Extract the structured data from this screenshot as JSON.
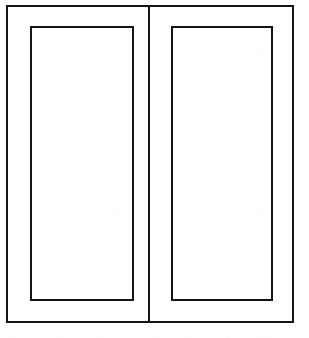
{
  "drawing": {
    "subject": "double-door-elevation",
    "description": "Line drawing of a two-leaf panelled door seen in elevation",
    "background_color": "#ffffff",
    "line_color": "#151515",
    "line_width": 2,
    "canvas": {
      "width": 309,
      "height": 338
    },
    "outer_frame": {
      "name": "outer-frame",
      "x": 7,
      "y": 6,
      "width": 286,
      "height": 316,
      "right": 293,
      "bottom": 322
    },
    "mullion": {
      "name": "center-mullion",
      "x": 149,
      "y_top": 6,
      "y_bottom": 322
    },
    "leaves": [
      {
        "name": "left-door-leaf",
        "side": "left",
        "stile_x": 7,
        "stile_right": 149,
        "panel": {
          "name": "left-door-panel",
          "x": 31,
          "y": 27,
          "width": 102,
          "height": 273,
          "right": 133,
          "bottom": 300
        }
      },
      {
        "name": "right-door-leaf",
        "side": "right",
        "stile_x": 149,
        "stile_right": 293,
        "panel": {
          "name": "right-door-panel",
          "x": 172,
          "y": 27,
          "width": 100,
          "height": 273,
          "right": 272,
          "bottom": 300
        }
      }
    ],
    "labels": {
      "title": "",
      "caption": "",
      "annotations": []
    }
  }
}
